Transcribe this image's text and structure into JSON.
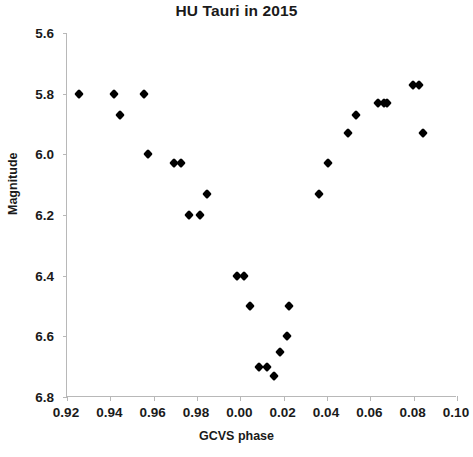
{
  "chart_data": {
    "type": "scatter",
    "title": "HU Tauri in 2015",
    "xlabel": "GCVS phase",
    "ylabel": "Magnitude",
    "xlim": [
      0.92,
      1.1
    ],
    "ylim": [
      5.6,
      6.8
    ],
    "y_inverted": true,
    "grid": false,
    "legend": null,
    "marker": "diamond",
    "marker_color": "#000000",
    "xticks": [
      "0.92",
      "0.94",
      "0.96",
      "0.98",
      "0.00",
      "0.02",
      "0.04",
      "0.06",
      "0.08",
      "0.10"
    ],
    "xtick_values": [
      0.92,
      0.94,
      0.96,
      0.98,
      1.0,
      1.02,
      1.04,
      1.06,
      1.08,
      1.1
    ],
    "yticks": [
      "5.6",
      "5.8",
      "6.0",
      "6.2",
      "6.4",
      "6.6",
      "6.8"
    ],
    "ytick_values": [
      5.6,
      5.8,
      6.0,
      6.2,
      6.4,
      6.6,
      6.8
    ],
    "x": [
      0.9255,
      0.9415,
      0.9445,
      0.9555,
      0.9575,
      0.9695,
      0.9725,
      0.9765,
      0.9815,
      0.9845,
      0.9985,
      1.0015,
      1.0045,
      1.0085,
      1.0125,
      1.0155,
      1.0185,
      1.0215,
      1.0225,
      1.0365,
      1.0405,
      1.0495,
      1.0535,
      1.0635,
      1.0665,
      1.0675,
      1.0795,
      1.0825,
      1.0845
    ],
    "y": [
      5.8,
      5.8,
      5.87,
      5.8,
      6.0,
      6.03,
      6.03,
      6.2,
      6.2,
      6.13,
      6.4,
      6.4,
      6.5,
      6.7,
      6.7,
      6.73,
      6.65,
      6.6,
      6.5,
      6.13,
      6.03,
      5.93,
      5.87,
      5.83,
      5.83,
      5.83,
      5.77,
      5.77,
      5.93
    ],
    "points": [
      {
        "x": 0.9255,
        "y": 5.8
      },
      {
        "x": 0.9415,
        "y": 5.8
      },
      {
        "x": 0.9445,
        "y": 5.87
      },
      {
        "x": 0.9555,
        "y": 5.8
      },
      {
        "x": 0.9575,
        "y": 6.0
      },
      {
        "x": 0.9695,
        "y": 6.03
      },
      {
        "x": 0.9725,
        "y": 6.03
      },
      {
        "x": 0.9765,
        "y": 6.2
      },
      {
        "x": 0.9815,
        "y": 6.2
      },
      {
        "x": 0.9845,
        "y": 6.13
      },
      {
        "x": 0.9985,
        "y": 6.4
      },
      {
        "x": 1.0015,
        "y": 6.4
      },
      {
        "x": 1.0045,
        "y": 6.5
      },
      {
        "x": 1.0085,
        "y": 6.7
      },
      {
        "x": 1.0125,
        "y": 6.7
      },
      {
        "x": 1.0155,
        "y": 6.73
      },
      {
        "x": 1.0185,
        "y": 6.65
      },
      {
        "x": 1.0215,
        "y": 6.6
      },
      {
        "x": 1.0225,
        "y": 6.5
      },
      {
        "x": 1.0365,
        "y": 6.13
      },
      {
        "x": 1.0405,
        "y": 6.03
      },
      {
        "x": 1.0495,
        "y": 5.93
      },
      {
        "x": 1.0535,
        "y": 5.87
      },
      {
        "x": 1.0635,
        "y": 5.83
      },
      {
        "x": 1.0665,
        "y": 5.83
      },
      {
        "x": 1.0675,
        "y": 5.83
      },
      {
        "x": 1.0795,
        "y": 5.77
      },
      {
        "x": 1.0825,
        "y": 5.77
      },
      {
        "x": 1.0845,
        "y": 5.93
      }
    ]
  }
}
